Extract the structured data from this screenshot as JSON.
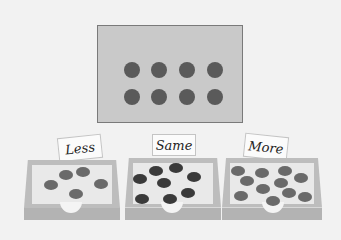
{
  "display": {
    "background": "#c9c9c9",
    "dot_color": "#5a5a5a",
    "dot_count": 8,
    "rows": 2,
    "cols": 4
  },
  "bins": [
    {
      "label": "Less",
      "chip_count": 5,
      "chip_color": "#6a6a6a"
    },
    {
      "label": "Same",
      "chip_count": 8,
      "chip_color": "#3a3a3a"
    },
    {
      "label": "More",
      "chip_count": 11,
      "chip_color": "#6a6a6a"
    }
  ]
}
